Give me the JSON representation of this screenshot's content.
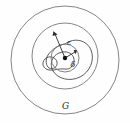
{
  "figure": {
    "background_color": "#fefefe",
    "width": 130,
    "height": 123,
    "labels": {
      "domain": "G",
      "epsilon": "ε",
      "delta": "δ"
    },
    "colors": {
      "boundary_stroke": "#777777",
      "inner_stroke": "#6b6b6b",
      "curve_stroke": "#4a4a4a",
      "arrow_stroke": "#2e2e2e",
      "point_fill": "#111111",
      "text_fill": "#2b2b2b"
    },
    "elements": {
      "outer_circle": {
        "name": "domain-boundary-circle",
        "cx": 65,
        "cy": 60,
        "r": 54
      },
      "middle_circle": {
        "name": "epsilon-neighborhood-circle",
        "cx": 65,
        "cy": 56,
        "r": 33
      },
      "delta_circle": {
        "name": "delta-neighborhood-circle",
        "cx": 65,
        "cy": 58,
        "r": 14
      },
      "center_point": {
        "name": "center-point",
        "cx": 65,
        "cy": 58,
        "r": 2.2
      },
      "epsilon_arrow": {
        "name": "epsilon-radius-arrow",
        "from_x": 65,
        "from_y": 58,
        "to_x": 53.5,
        "to_y": 31.5,
        "label_x": 67,
        "label_y": 45
      },
      "delta_arrow": {
        "name": "delta-radius-arrow",
        "from_x": 65,
        "from_y": 58,
        "to_x": 76.5,
        "to_y": 50.5,
        "label_x": 71,
        "label_y": 66
      },
      "domain_label": {
        "name": "domain-label-G",
        "x": 65,
        "y": 108
      },
      "winding_curve": {
        "name": "winding-path-curve",
        "description": "closed looping curve passing through the delta neighborhood with a small left loop and a large right lobe"
      }
    }
  }
}
